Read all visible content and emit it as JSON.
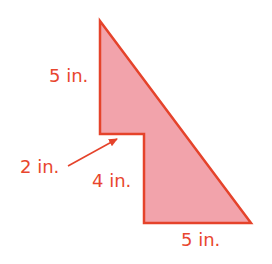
{
  "figure": {
    "shape": "composite-polygon",
    "colors": {
      "stroke": "#e5432b",
      "fill": "#f2a3ab",
      "text": "#e8462e"
    },
    "vertices": [
      [
        100,
        21
      ],
      [
        251,
        223
      ],
      [
        144,
        223
      ],
      [
        144,
        134
      ],
      [
        100,
        134
      ]
    ],
    "labels": {
      "left_side": "5 in.",
      "notch_width": "2 in.",
      "inner_vertical": "4 in.",
      "bottom_side": "5 in."
    },
    "arrow": {
      "from": [
        68,
        166
      ],
      "to": [
        117,
        139
      ]
    }
  }
}
